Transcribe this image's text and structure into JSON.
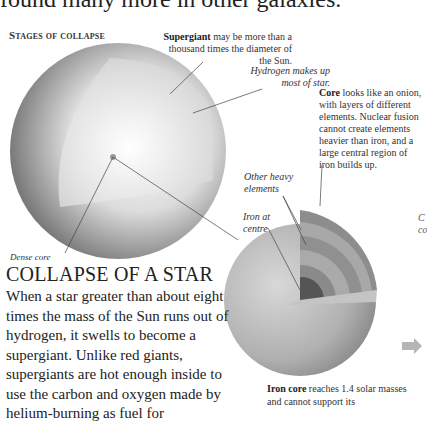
{
  "intro_line": "found many more in other galaxies.",
  "section_label": "Stages of collapse",
  "labels": {
    "supergiant": {
      "bold": "Supergiant",
      "text": " may be more than a thousand times the diameter of the Sun."
    },
    "hydrogen": "Hydrogen makes up most of star.",
    "core": {
      "bold": "Core",
      "text": " looks like an onion, with layers of different elements. Nuclear fusion cannot create elements heavier than iron, and a large central region of iron builds up."
    },
    "other_heavy": "Other heavy elements",
    "iron_centre": "Iron at centre",
    "dense_core": "Dense core",
    "iron_core": {
      "bold": "Iron core",
      "text": " reaches 1.4 solar masses and cannot support its"
    },
    "edge_cut": "C co"
  },
  "article": {
    "title": "COLLAPSE OF A STAR",
    "body": "When a star greater than about eight times the mass of the Sun runs out of hydrogen, it swells to become a supergiant. Unlike red giants, supergiants are hot enough inside to use the carbon and oxygen made by helium-burning as fuel for"
  },
  "colors": {
    "text": "#222222",
    "sphere_dark": "#6e6e6e",
    "sphere_light": "#f4f4f4",
    "arrow": "#b5b5b5"
  }
}
